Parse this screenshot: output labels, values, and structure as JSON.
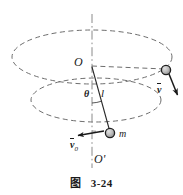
{
  "figure": {
    "caption_cjk": "图",
    "caption_number": "3-24"
  },
  "labels": {
    "pivot": "O",
    "axis_bottom": "O'",
    "angle": "θ",
    "string_length": "l",
    "mass": "m",
    "velocity_initial_symbol": "v",
    "velocity_initial_subscript": "0",
    "velocity_symbol": "v"
  },
  "colors": {
    "ink": "#1a1a1a",
    "dashed_line": "#6e6e6e",
    "axis_line": "#8a8a8a",
    "bob_fill": "#b8b8b8",
    "background": "#ffffff"
  },
  "geometry": {
    "pivot_point": [
      92,
      66
    ],
    "axis_top": [
      92,
      14
    ],
    "axis_bottom": [
      92,
      168
    ],
    "mass_point": [
      110,
      133
    ],
    "second_bob_point": [
      166,
      70
    ],
    "upper_ellipse": {
      "cx": 92,
      "cy": 57,
      "rx": 80,
      "ry": 27
    },
    "lower_ellipse": {
      "cx": 96,
      "cy": 100,
      "rx": 65,
      "ry": 22
    },
    "v0_arrow": {
      "from": [
        103,
        131
      ],
      "to": [
        77,
        136
      ]
    },
    "v_arrow": {
      "from": [
        170,
        75
      ],
      "to": [
        178,
        96
      ]
    }
  }
}
